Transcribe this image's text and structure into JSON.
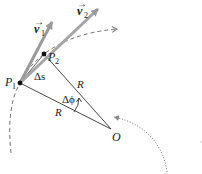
{
  "diagram": {
    "colors": {
      "line": "#333333",
      "vector": "#9a9a9a",
      "dashed_path": "#777777",
      "dotted_path": "#888888",
      "point": "#111111"
    },
    "points": {
      "p1": {
        "label": "P",
        "sub": "1",
        "x": 20,
        "y": 83
      },
      "p2": {
        "label": "P",
        "sub": "2",
        "x": 44,
        "y": 54
      },
      "o": {
        "label": "O",
        "x": 111,
        "y": 129
      }
    },
    "vectors": {
      "v1": {
        "symbol": "v",
        "arrow": "→",
        "sub": "1"
      },
      "v2": {
        "symbol": "v",
        "arrow": "→",
        "sub": "2"
      }
    },
    "labels": {
      "arc_length": "Δs",
      "radius_upper": "R",
      "radius_lower": "R",
      "angle": "Δϕ"
    }
  }
}
